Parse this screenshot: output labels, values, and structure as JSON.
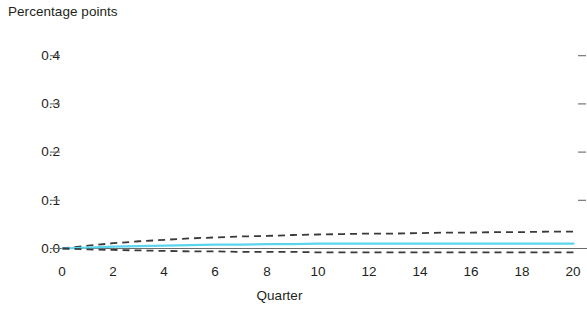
{
  "chart_data": {
    "type": "line",
    "title": "",
    "subtitle": "",
    "xlabel": "Quarter",
    "ylabel": "Percentage points",
    "xlim": [
      0,
      20
    ],
    "ylim": [
      -0.02,
      0.45
    ],
    "grid": false,
    "legend": null,
    "x_ticks": [
      "0",
      "2",
      "4",
      "6",
      "8",
      "10",
      "12",
      "14",
      "16",
      "18",
      "20"
    ],
    "x_tick_values": [
      0,
      2,
      4,
      6,
      8,
      10,
      12,
      14,
      16,
      18,
      20
    ],
    "y_ticks": [
      "0.0",
      "0.1",
      "0.2",
      "0.3",
      "0.4"
    ],
    "y_tick_values": [
      0.0,
      0.1,
      0.2,
      0.3,
      0.4
    ],
    "x": [
      0,
      1,
      2,
      3,
      4,
      5,
      6,
      7,
      8,
      9,
      10,
      11,
      12,
      13,
      14,
      15,
      16,
      17,
      18,
      19,
      20
    ],
    "series": [
      {
        "name": "Upper confidence bound",
        "style": "dashed",
        "color": "#3a3a3a",
        "values": [
          0.0,
          0.006,
          0.011,
          0.015,
          0.018,
          0.021,
          0.023,
          0.025,
          0.026,
          0.028,
          0.029,
          0.03,
          0.031,
          0.031,
          0.032,
          0.033,
          0.033,
          0.034,
          0.034,
          0.035,
          0.035
        ]
      },
      {
        "name": "Point estimate",
        "style": "solid",
        "color": "#5bd5ee",
        "values": [
          0.0,
          0.002,
          0.004,
          0.005,
          0.006,
          0.007,
          0.008,
          0.008,
          0.009,
          0.009,
          0.01,
          0.01,
          0.01,
          0.01,
          0.01,
          0.01,
          0.01,
          0.01,
          0.01,
          0.01,
          0.01
        ]
      },
      {
        "name": "Lower confidence bound",
        "style": "dashed",
        "color": "#3a3a3a",
        "values": [
          0.0,
          -0.002,
          -0.003,
          -0.004,
          -0.005,
          -0.006,
          -0.006,
          -0.007,
          -0.007,
          -0.007,
          -0.008,
          -0.008,
          -0.008,
          -0.008,
          -0.008,
          -0.008,
          -0.008,
          -0.008,
          -0.008,
          -0.008,
          -0.008
        ]
      }
    ],
    "axis_color": "#6b6b6b",
    "zero_axis_line": true
  },
  "axes": {
    "y_title": "Percentage points",
    "x_title": "Quarter"
  },
  "y_tick_labels": [
    {
      "label": "0.4"
    },
    {
      "label": "0.3"
    },
    {
      "label": "0.2"
    },
    {
      "label": "0.1"
    },
    {
      "label": "0.0"
    }
  ],
  "x_tick_labels": [
    {
      "label": "0"
    },
    {
      "label": "2"
    },
    {
      "label": "4"
    },
    {
      "label": "6"
    },
    {
      "label": "8"
    },
    {
      "label": "10"
    },
    {
      "label": "12"
    },
    {
      "label": "14"
    },
    {
      "label": "16"
    },
    {
      "label": "18"
    },
    {
      "label": "20"
    }
  ]
}
